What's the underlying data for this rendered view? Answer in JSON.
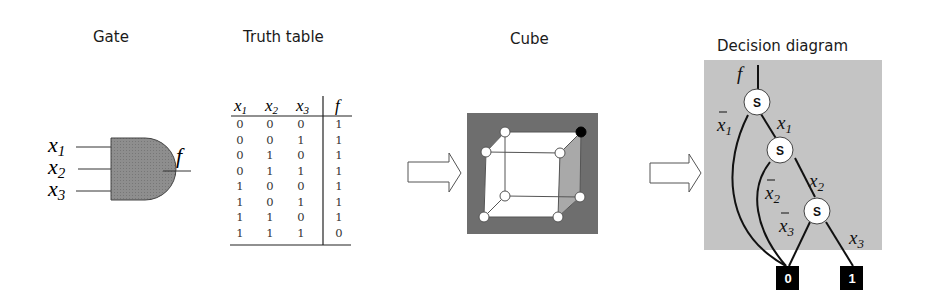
{
  "panels": {
    "gate": {
      "title": "Gate",
      "inputs": [
        "x1",
        "x2",
        "x3"
      ],
      "input_labels": [
        {
          "var": "x",
          "sub": "1"
        },
        {
          "var": "x",
          "sub": "2"
        },
        {
          "var": "x",
          "sub": "3"
        }
      ],
      "output_label": "f",
      "gate_type": "and-gate-icon",
      "fill_color": "#8a8a8a"
    },
    "truth_table": {
      "title": "Truth table",
      "headers": [
        {
          "var": "x",
          "sub": "1"
        },
        {
          "var": "x",
          "sub": "2"
        },
        {
          "var": "x",
          "sub": "3"
        },
        {
          "var": "f",
          "sub": ""
        }
      ],
      "rows": [
        [
          "0",
          "0",
          "0",
          "1"
        ],
        [
          "0",
          "0",
          "1",
          "1"
        ],
        [
          "0",
          "1",
          "0",
          "1"
        ],
        [
          "0",
          "1",
          "1",
          "1"
        ],
        [
          "1",
          "0",
          "0",
          "1"
        ],
        [
          "1",
          "0",
          "1",
          "1"
        ],
        [
          "1",
          "1",
          "0",
          "1"
        ],
        [
          "1",
          "1",
          "1",
          "0"
        ]
      ]
    },
    "cube": {
      "title": "Cube",
      "background_color": "#6e6e6e",
      "highlight_face_color": "#a9a9a9",
      "vertex_count": 8,
      "filled_vertex": "top-right-back"
    },
    "decision_diagram": {
      "title": "Decision diagram",
      "background_color": "#c4c4c4",
      "root_label": "f",
      "nodes": [
        {
          "label": "S",
          "low_edge": {
            "var": "x",
            "sub": "1",
            "negated": true
          },
          "high_edge": {
            "var": "x",
            "sub": "1",
            "negated": false
          }
        },
        {
          "label": "S",
          "low_edge": {
            "var": "x",
            "sub": "2",
            "negated": true
          },
          "high_edge": {
            "var": "x",
            "sub": "2",
            "negated": false
          }
        },
        {
          "label": "S",
          "low_edge": {
            "var": "x",
            "sub": "3",
            "negated": true
          },
          "high_edge": {
            "var": "x",
            "sub": "3",
            "negated": false
          }
        }
      ],
      "terminals": [
        "0",
        "1"
      ]
    }
  },
  "arrows": [
    "right-arrow-icon",
    "right-arrow-icon"
  ]
}
